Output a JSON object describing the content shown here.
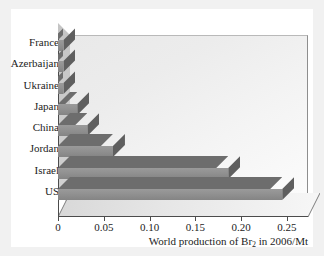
{
  "chart_data": {
    "type": "bar",
    "orientation": "horizontal",
    "title": "",
    "xlabel_parts": {
      "before": "World production of Br",
      "subscript": "2",
      "after": " in 2006/Mt"
    },
    "xlabel": "World production of Br2 in 2006/Mt",
    "ylabel": "",
    "categories": [
      "France",
      "Azerbaijan",
      "Ukraine",
      "Japan",
      "China",
      "Jordan",
      "Israel",
      "US"
    ],
    "values": [
      0.006,
      0.006,
      0.006,
      0.021,
      0.032,
      0.06,
      0.186,
      0.245
    ],
    "xlim": [
      0,
      0.26
    ],
    "xticks": [
      0,
      0.05,
      0.1,
      0.15,
      0.2,
      0.25
    ],
    "xtick_labels": [
      "0",
      "0.05",
      "0.10",
      "0.15",
      "0.20",
      "0.25"
    ],
    "grid": false,
    "legend": null,
    "style": "3d-bar",
    "colors": {
      "bar_front": "#919191",
      "bar_top": "#6d6d6d",
      "bar_side": "#5f5f5f",
      "plot_background": "#f2f2f2",
      "axis": "#4c4c4c",
      "text": "#1c1c1c",
      "figure_background": "#ffffff",
      "page_background": "#f1f1f1"
    }
  }
}
